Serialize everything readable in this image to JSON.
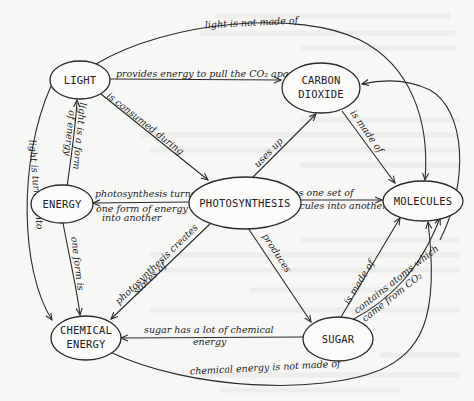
{
  "diagram": {
    "type": "concept-map",
    "nodes": {
      "light": "LIGHT",
      "carbon_dioxide_1": "CARBON",
      "carbon_dioxide_2": "DIOXIDE",
      "energy": "ENERGY",
      "photosynthesis": "PHOTOSYNTHESIS",
      "molecules": "MOLECULES",
      "chemical_energy_1": "CHEMICAL",
      "chemical_energy_2": "ENERGY",
      "sugar": "SUGAR"
    },
    "links": {
      "light_not_molecules": "light is not made of",
      "light_provides": "provides energy to pull the CO₂ apart",
      "light_consumed": "is consumed during",
      "light_form_energy_1": "light is a form",
      "light_form_energy_2": "of energy",
      "light_turned_into": "light is turned into",
      "photo_energy_1": "photosynthesis turns",
      "photo_energy_2": "one form of energy",
      "photo_energy_3": "into another",
      "photo_uses_co2": "uses up",
      "co2_made_of": "is made of",
      "photo_molecules_1": "turns one set of",
      "photo_molecules_2": "molecules into another",
      "energy_one_form": "one form is",
      "photo_stores_1": "photosynthesis creates",
      "photo_stores_2": "stores of",
      "photo_produces": "produces",
      "sugar_made_of": "is made of",
      "sugar_contains_1": "contains atoms which",
      "sugar_contains_2": "came from CO₂",
      "sugar_chem_1": "sugar has a lot of chemical",
      "sugar_chem_2": "energy",
      "chem_not_molecules": "chemical energy is not made of"
    }
  }
}
